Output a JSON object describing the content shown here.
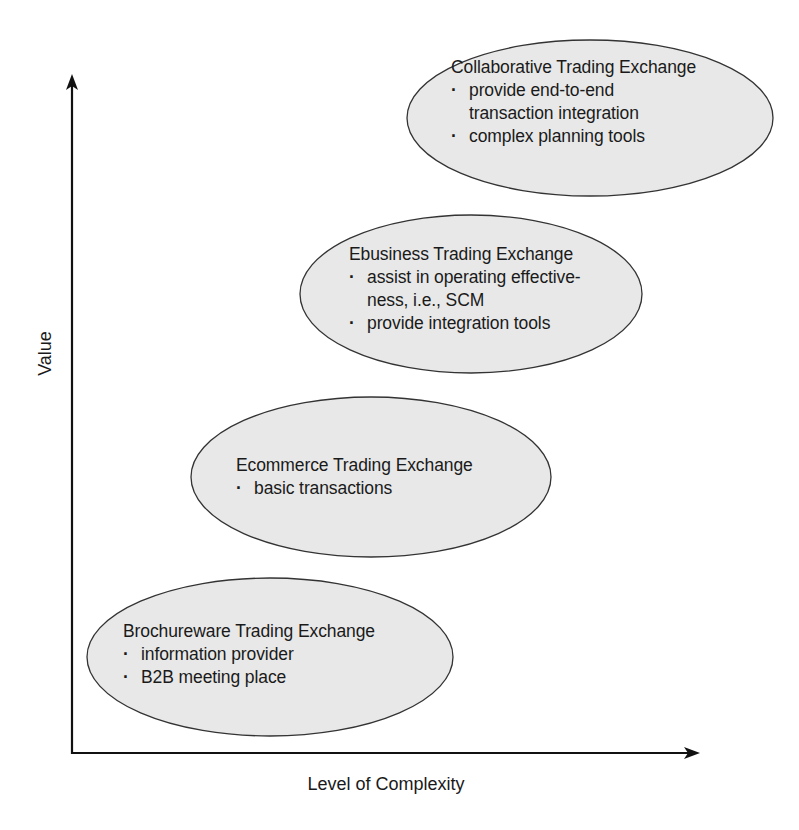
{
  "diagram": {
    "axes": {
      "y_label": "Value",
      "x_label": "Level of Complexity"
    },
    "colors": {
      "ellipse_fill": "#e8e8e8",
      "ellipse_stroke": "#333333",
      "axis": "#111111",
      "text": "#1a1a1a",
      "background": "#ffffff"
    },
    "stages": [
      {
        "title": "Brochureware Trading Exchange",
        "bullets": [
          "information provider",
          "B2B meeting place"
        ]
      },
      {
        "title": "Ecommerce Trading Exchange",
        "bullets": [
          "basic transactions"
        ]
      },
      {
        "title": "Ebusiness Trading Exchange",
        "bullets": [
          "assist in operating effective-",
          "ness, i.e., SCM",
          "provide integration tools"
        ]
      },
      {
        "title": "Collaborative Trading Exchange",
        "bullets": [
          "provide end-to-end",
          "transaction integration",
          "complex planning tools"
        ]
      }
    ],
    "bullet_glyph": "·"
  }
}
